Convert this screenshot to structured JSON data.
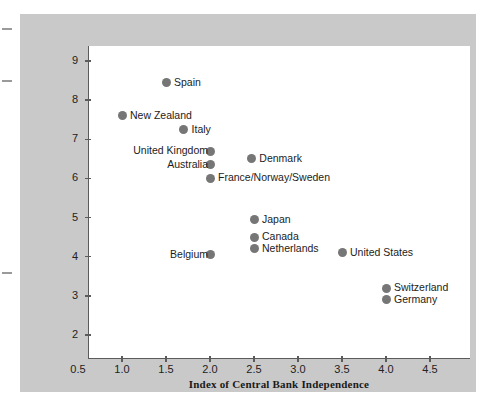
{
  "figure": {
    "background_color": "#c9c9c9",
    "plot_background_color": "#ffffff",
    "axis_color": "#5b5b5b",
    "marker_color": "#767676"
  },
  "chart_data": {
    "type": "scatter",
    "title": "",
    "xlabel": "Index of Central Bank Independence",
    "ylabel": "Average inflation (percent per year)",
    "xlim": [
      0.5,
      4.75
    ],
    "ylim": [
      2,
      9.4
    ],
    "xticks": [
      "0.5",
      "1.0",
      "1.5",
      "2.0",
      "2.5",
      "3.0",
      "3.5",
      "4.0",
      "4.5"
    ],
    "xtick_values": [
      0.5,
      1.0,
      1.5,
      2.0,
      2.5,
      3.0,
      3.5,
      4.0,
      4.5
    ],
    "yticks": [
      "2",
      "3",
      "4",
      "5",
      "6",
      "7",
      "8",
      "9"
    ],
    "ytick_values": [
      2,
      3,
      4,
      5,
      6,
      7,
      8,
      9
    ],
    "grid": false,
    "legend": "none",
    "points": [
      {
        "label": "Spain",
        "x": 1.5,
        "y": 8.45,
        "label_side": "right"
      },
      {
        "label": "New Zealand",
        "x": 1.0,
        "y": 7.6,
        "label_side": "right"
      },
      {
        "label": "Italy",
        "x": 1.7,
        "y": 7.25,
        "label_side": "right"
      },
      {
        "label": "United Kingdom",
        "x": 2.0,
        "y": 6.7,
        "label_side": "left"
      },
      {
        "label": "Denmark",
        "x": 2.47,
        "y": 6.5,
        "label_side": "right"
      },
      {
        "label": "Australia",
        "x": 2.0,
        "y": 6.35,
        "label_side": "left"
      },
      {
        "label": "France/Norway/Sweden",
        "x": 2.0,
        "y": 6.0,
        "label_side": "right"
      },
      {
        "label": "Japan",
        "x": 2.5,
        "y": 4.95,
        "label_side": "right"
      },
      {
        "label": "Canada",
        "x": 2.5,
        "y": 4.5,
        "label_side": "right"
      },
      {
        "label": "Netherlands",
        "x": 2.5,
        "y": 4.2,
        "label_side": "right"
      },
      {
        "label": "United States",
        "x": 3.5,
        "y": 4.1,
        "label_side": "right"
      },
      {
        "label": "Belgium",
        "x": 2.0,
        "y": 4.05,
        "label_side": "left"
      },
      {
        "label": "Switzerland",
        "x": 4.0,
        "y": 3.2,
        "label_side": "right"
      },
      {
        "label": "Germany",
        "x": 4.0,
        "y": 2.9,
        "label_side": "right"
      }
    ]
  }
}
